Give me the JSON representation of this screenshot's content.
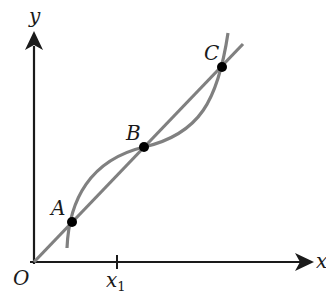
{
  "diagram": {
    "axes": {
      "x_label": "x",
      "y_label": "y",
      "origin_label": "O",
      "tick_label_main": "x",
      "tick_label_sub": "1"
    },
    "points": [
      {
        "label": "A"
      },
      {
        "label": "B"
      },
      {
        "label": "C"
      }
    ],
    "elements": {
      "line": "straight line through origin passing through A, B, C",
      "curve": "cubic curve intersecting the line at A, B, C"
    },
    "colors": {
      "axis": "#1a1a1a",
      "curve": "#808080",
      "line": "#808080",
      "point": "#000000"
    }
  }
}
